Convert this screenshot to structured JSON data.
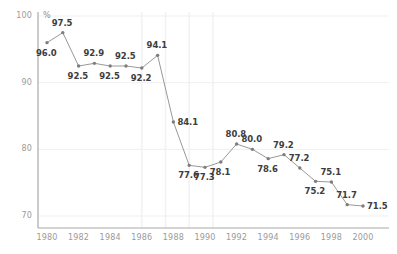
{
  "chart_data": {
    "type": "line",
    "title": "",
    "subtitle": "",
    "xlabel": "",
    "ylabel": "%",
    "unit_label": "%",
    "xlim": [
      1979.4,
      2001.0
    ],
    "ylim": [
      68.5,
      101.5
    ],
    "yticks": [
      70,
      80,
      90,
      100
    ],
    "ytick_labels": [
      "70",
      "80",
      "90",
      "100"
    ],
    "xticks": [
      1980,
      1982,
      1984,
      1986,
      1988,
      1990,
      1992,
      1994,
      1996,
      1998,
      2000
    ],
    "xtick_labels": [
      "1980",
      "1982",
      "1984",
      "1986",
      "1988",
      "1990",
      "1992",
      "1994",
      "1996",
      "1998",
      "2000"
    ],
    "grid": "horizontal-and-partial-vertical",
    "vertical_gridline_years": [
      1986,
      1987.5,
      1989,
      1990.5
    ],
    "legend": "none",
    "series_color": "#8c8c8c",
    "label_color": "#3d3d3d",
    "axis_color": "#9a9a9a",
    "grid_color": "#efefef",
    "x": [
      1980,
      1981,
      1982,
      1983,
      1984,
      1985,
      1986,
      1987,
      1988,
      1989,
      1990,
      1991,
      1992,
      1993,
      1994,
      1995,
      1996,
      1997,
      1998,
      1999,
      2000
    ],
    "values": [
      96.0,
      97.5,
      92.5,
      92.9,
      92.5,
      92.5,
      92.2,
      94.1,
      84.1,
      77.6,
      77.3,
      78.1,
      80.8,
      80.0,
      78.6,
      79.2,
      77.2,
      75.2,
      75.1,
      71.7,
      71.5
    ],
    "point_labels": [
      {
        "year": 1980,
        "value": 96.0,
        "text": "96.0",
        "pos": "below"
      },
      {
        "year": 1981,
        "value": 97.5,
        "text": "97.5",
        "pos": "above"
      },
      {
        "year": 1982,
        "value": 92.5,
        "text": "92.5",
        "pos": "below"
      },
      {
        "year": 1983,
        "value": 92.9,
        "text": "92.9",
        "pos": "above"
      },
      {
        "year": 1984,
        "value": 92.5,
        "text": "92.5",
        "pos": "below"
      },
      {
        "year": 1985,
        "value": 92.5,
        "text": "92.5",
        "pos": "above"
      },
      {
        "year": 1986,
        "value": 92.2,
        "text": "92.2",
        "pos": "below"
      },
      {
        "year": 1987,
        "value": 94.1,
        "text": "94.1",
        "pos": "above"
      },
      {
        "year": 1988,
        "value": 84.1,
        "text": "84.1",
        "pos": "right"
      },
      {
        "year": 1989,
        "value": 77.6,
        "text": "77.6",
        "pos": "below"
      },
      {
        "year": 1990,
        "value": 77.3,
        "text": "77.3",
        "pos": "below"
      },
      {
        "year": 1991,
        "value": 78.1,
        "text": "78.1",
        "pos": "below"
      },
      {
        "year": 1992,
        "value": 80.8,
        "text": "80.8",
        "pos": "above"
      },
      {
        "year": 1993,
        "value": 80.0,
        "text": "80.0",
        "pos": "above"
      },
      {
        "year": 1994,
        "value": 78.6,
        "text": "78.6",
        "pos": "below"
      },
      {
        "year": 1995,
        "value": 79.2,
        "text": "79.2",
        "pos": "above"
      },
      {
        "year": 1996,
        "value": 77.2,
        "text": "77.2",
        "pos": "above"
      },
      {
        "year": 1997,
        "value": 75.2,
        "text": "75.2",
        "pos": "below"
      },
      {
        "year": 1998,
        "value": 75.1,
        "text": "75.1",
        "pos": "above"
      },
      {
        "year": 1999,
        "value": 71.7,
        "text": "71.7",
        "pos": "above"
      },
      {
        "year": 2000,
        "value": 71.5,
        "text": "71.5",
        "pos": "right"
      }
    ]
  }
}
